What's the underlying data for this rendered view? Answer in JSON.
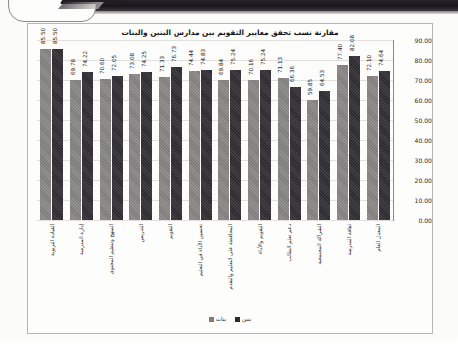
{
  "document": {
    "artifact_top_band": "scanned-page-dark-edge",
    "artifact_corner": "curled-page-corner"
  },
  "chart_data": {
    "type": "bar",
    "title": "مقارنة نسب تحقق معايير التقويم بين مدارس البنين والبنات",
    "xlabel": "",
    "ylabel": "",
    "ylim": [
      0,
      90
    ],
    "ytick_step": 10,
    "grid": true,
    "direction": "rtl",
    "legend_position": "bottom",
    "yticks": [
      "0.00",
      "10.00",
      "20.00",
      "30.00",
      "40.00",
      "50.00",
      "60.00",
      "70.00",
      "80.00",
      "90.00"
    ],
    "categories": [
      "المعدل العام",
      "ثقافة المدرسة",
      "الشراكة المجتمعية",
      "دعم تعلم الطالب",
      "التقويم والأداء",
      "المحافظة على التعليم والتقدم",
      "تحسين الأداء في التعليم",
      "التقويم",
      "التدريس",
      "المنهج وتنظيم المحتوى",
      "إدارة المدرسة",
      "القيادة التربوية"
    ],
    "series": [
      {
        "name": "بنات",
        "color": "#7f7d7b",
        "values": [
          72.1,
          77.4,
          59.85,
          71.13,
          70.16,
          69.84,
          74.44,
          71.33,
          73.08,
          70.6,
          69.78,
          85.5
        ]
      },
      {
        "name": "بنين",
        "color": "#2d2b2f",
        "values": [
          74.64,
          82.08,
          64.53,
          66.36,
          75.24,
          75.24,
          74.83,
          76.73,
          74.25,
          72.05,
          74.22,
          85.5
        ]
      }
    ]
  }
}
